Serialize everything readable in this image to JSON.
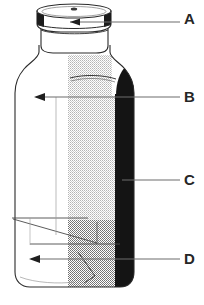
{
  "figure": {
    "type": "technical-line-drawing",
    "view": "perspective cutaway with shaded bands",
    "background_color": "#ffffff",
    "line_color": "#2b2b2b",
    "caption_partial": ""
  },
  "callouts": [
    {
      "id": "A",
      "label": "A",
      "target": "cap",
      "leader": {
        "has_arrowhead": true,
        "direction": "left",
        "y": 22
      }
    },
    {
      "id": "B",
      "label": "B",
      "target": "bottle-wall",
      "leader": {
        "has_arrowhead": true,
        "direction": "left",
        "y": 97
      }
    },
    {
      "id": "C",
      "label": "C",
      "target": "dark-band",
      "leader": {
        "has_arrowhead": false,
        "direction": "left",
        "y": 180
      }
    },
    {
      "id": "D",
      "label": "D",
      "target": "base-interior",
      "leader": {
        "has_arrowhead": true,
        "direction": "left",
        "y": 259
      }
    }
  ],
  "shading": {
    "stipple_light_color": "#c9c9c9",
    "stipple_dark_color": "#8e8e8e",
    "solid_dark_color": "#141414",
    "stipple_light_label": "light stipple band",
    "stipple_dark_label": "dense stipple band",
    "solid_dark_label": "solid black band"
  },
  "geometry": {
    "cap_top_ellipse": "flat ellipse",
    "neck": "short cylindrical neck",
    "shoulder": "rounded shoulder",
    "body": "tall rectangular body with rounded base corners",
    "base": "perspective base with diagonal edge lines"
  }
}
